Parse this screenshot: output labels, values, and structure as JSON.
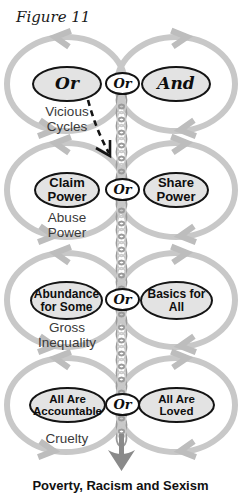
{
  "figure_label": "Figure 11",
  "caption": "Poverty, Racism and Sexism",
  "sections": [
    {
      "id": "vicious-cycles",
      "left": "Or",
      "connector": "Or",
      "right": "And",
      "label": "Vicious Cycles"
    },
    {
      "id": "abuse-power",
      "left": "Claim Power",
      "connector": "Or",
      "right": "Share Power",
      "label": "Abuse Power"
    },
    {
      "id": "gross-inequality",
      "left": "Abundance for Some",
      "connector": "Or",
      "right": "Basics for All",
      "label": "Gross Inequality"
    },
    {
      "id": "cruelty",
      "left": "All Are Accountable",
      "connector": "Or",
      "right": "All Are Loved",
      "label": "Cruelty"
    }
  ],
  "icons": {
    "loop_arrows": "cycle-arrowhead-icon",
    "center_strand": "twisted-chain-icon",
    "pointer": "dashed-arrow-icon",
    "terminal": "down-arrow-icon"
  },
  "colors": {
    "loop": "#c8c8c8",
    "loop_arrowhead": "#bdbdbd",
    "oval_fill": "#e3e3e3",
    "oval_border": "#141414",
    "chain": "#9a9a9a",
    "chain_highlight": "#c9c9c9",
    "terminal_arrow": "#8a8a8a",
    "label_text": "#3a3a3a",
    "text": "#111111"
  }
}
